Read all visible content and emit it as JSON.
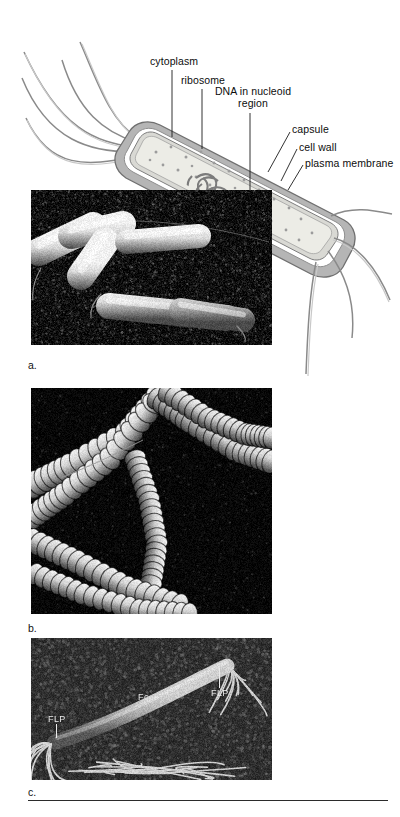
{
  "figure": {
    "type": "bacterial-cell-anatomy-figure",
    "diagram": {
      "title": "Prokaryotic (bacterial) cell cutaway diagram",
      "labels": [
        {
          "id": "cytoplasm",
          "text": "cytoplasm"
        },
        {
          "id": "ribosome",
          "text": "ribosome"
        },
        {
          "id": "dna-nucleoid",
          "text": "DNA in nucleoid region"
        },
        {
          "id": "capsule",
          "text": "capsule"
        },
        {
          "id": "cell-wall",
          "text": "cell wall"
        },
        {
          "id": "plasma-membrane",
          "text": "plasma membrane"
        }
      ],
      "structures": {
        "flagella_upper_left_count": 5,
        "flagella_lower_right_count": 4,
        "capsule_color": "#b9b9b9",
        "cell_wall_color": "#ffffff",
        "cytoplasm_color": "#e9e9e4",
        "nucleoid_color": "#8d8d8d"
      }
    },
    "panels": [
      {
        "id": "panel-a",
        "caption": "a.",
        "subject": "rod-shaped bacilli (scanning electron micrograph)",
        "annotations": []
      },
      {
        "id": "panel-b",
        "caption": "b.",
        "subject": "chains of cells, streptobacilli (scanning electron micrograph)",
        "annotations": []
      },
      {
        "id": "panel-c",
        "caption": "c.",
        "subject": "filamentous cell with flagella-like projections (scanning electron micrograph)",
        "annotations": [
          {
            "id": "flp-left",
            "text": "FLP"
          },
          {
            "id": "fc-center",
            "text": "Fc"
          },
          {
            "id": "flp-right",
            "text": "FLP"
          }
        ]
      }
    ]
  }
}
